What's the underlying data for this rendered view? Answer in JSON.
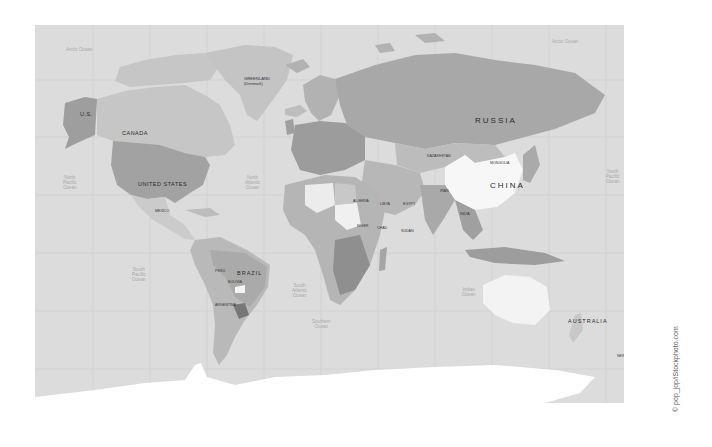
{
  "map": {
    "title": "World political map",
    "style": "grayscale",
    "colors": {
      "ocean": "#dcdcdc",
      "land_light": "#c8c8c8",
      "land_mid": "#b4b4b4",
      "land_dark": "#9a9a9a",
      "highlight_white": "#f7f7f7",
      "antarctica": "#ffffff"
    },
    "countries": {
      "us_alaska": "U.S.",
      "canada": "CANADA",
      "greenland": "GREENLAND",
      "greenland_sub": "(Denmark)",
      "united_states": "UNITED STATES",
      "brazil": "BRAZIL",
      "argentina": "ARGENTINA",
      "bolivia": "BOLIVIA",
      "peru": "PERU",
      "mexico": "MEXICO",
      "russia": "RUSSIA",
      "kazakhstan": "KAZAKHSTAN",
      "mongolia": "MONGOLIA",
      "china": "CHINA",
      "india": "INDIA",
      "iran": "IRAN",
      "algeria": "ALGERIA",
      "libya": "LIBYA",
      "egypt": "EGYPT",
      "niger": "NIGER",
      "chad": "CHAD",
      "sudan": "SUDAN",
      "australia": "AUSTRALIA",
      "new_zealand": "NEW ZEALAND"
    },
    "oceans": {
      "arctic_west": "Arctic Ocean",
      "arctic_east": "Arctic Ocean",
      "north_pacific_west": "North\nPacific\nOcean",
      "north_atlantic": "North\nAtlantic\nOcean",
      "north_pacific_east": "North\nPacific\nOcean",
      "south_pacific": "South\nPacific\nOcean",
      "south_atlantic": "South\nAtlantic\nOcean",
      "indian": "Indian\nOcean",
      "southern": "Southern\nOcean"
    },
    "credit": "© pop_jop/iStockphoto.com"
  }
}
